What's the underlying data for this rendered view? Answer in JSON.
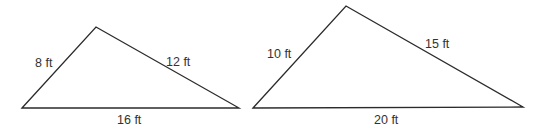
{
  "figure": {
    "colors": {
      "stroke": "#2b2b2b",
      "label": "#333333",
      "background": "#ffffff"
    },
    "triangles": [
      {
        "name": "triangle-small",
        "vertices": [
          [
            22,
            108
          ],
          [
            96,
            27
          ],
          [
            239,
            108
          ]
        ],
        "sides": {
          "left": "8 ft",
          "right": "12 ft",
          "base": "16 ft"
        }
      },
      {
        "name": "triangle-large",
        "vertices": [
          [
            253,
            108
          ],
          [
            346,
            6
          ],
          [
            523,
            107
          ]
        ],
        "sides": {
          "left": "10 ft",
          "right": "15 ft",
          "base": "20 ft"
        }
      }
    ]
  }
}
